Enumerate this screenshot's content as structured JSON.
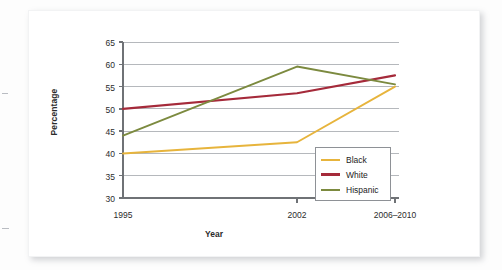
{
  "figure": {
    "background_color": "#ffffff",
    "card_color": "#ffffff"
  },
  "chart_data": {
    "type": "line",
    "title": "",
    "xlabel": "Year",
    "ylabel": "Percentage",
    "categories": [
      "1995",
      "2002",
      "2006–2010"
    ],
    "x_tick_labels": [
      "1995",
      "2002",
      "2006–2010"
    ],
    "y_tick_labels": [
      "30",
      "35",
      "40",
      "45",
      "50",
      "55",
      "60",
      "65"
    ],
    "ylim": [
      30,
      65
    ],
    "y_tick_step": 5,
    "grid": "horizontal",
    "legend_position": "inside-lower-right",
    "series": [
      {
        "name": "Black",
        "color": "#E7B43C",
        "values": [
          40.0,
          42.5,
          55.0
        ]
      },
      {
        "name": "White",
        "color": "#A52A3A",
        "values": [
          50.0,
          53.5,
          57.5
        ]
      },
      {
        "name": "Hispanic",
        "color": "#7C8A3F",
        "values": [
          44.0,
          59.5,
          55.5
        ]
      }
    ],
    "legend_entries": [
      {
        "label": "Black",
        "color": "#E7B43C"
      },
      {
        "label": "White",
        "color": "#A52A3A"
      },
      {
        "label": "Hispanic",
        "color": "#7C8A3F"
      }
    ],
    "axis_color": "#6f7276",
    "grid_color": "#b5b8bc"
  }
}
